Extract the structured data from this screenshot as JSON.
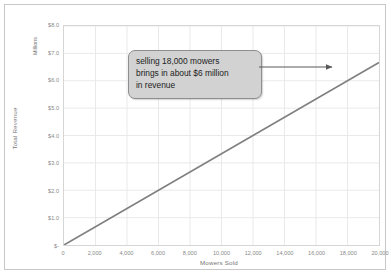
{
  "chart_data": {
    "type": "line",
    "title": "",
    "xlabel": "Mowers Sold",
    "ylabel": "Total Revenue",
    "y_unit_label": "Millions",
    "xlim": [
      0,
      20000
    ],
    "ylim": [
      0,
      8
    ],
    "grid": true,
    "legend": "none",
    "x_tick_labels": [
      "0",
      "2,000",
      "4,000",
      "6,000",
      "8,000",
      "10,000",
      "12,000",
      "14,000",
      "16,000",
      "18,000",
      "20,000"
    ],
    "x_tick_values": [
      0,
      2000,
      4000,
      6000,
      8000,
      10000,
      12000,
      14000,
      16000,
      18000,
      20000
    ],
    "y_tick_labels": [
      "$-",
      "$1.0",
      "$2.0",
      "$3.0",
      "$4.0",
      "$5.0",
      "$6.0",
      "$7.0",
      "$8.0"
    ],
    "y_tick_values": [
      0,
      1,
      2,
      3,
      4,
      5,
      6,
      7,
      8
    ],
    "series": [
      {
        "name": "Total Revenue",
        "color": "#808080",
        "x": [
          0,
          2000,
          4000,
          6000,
          8000,
          10000,
          12000,
          14000,
          16000,
          18000,
          20000
        ],
        "values": [
          0,
          0.667,
          1.333,
          2.0,
          2.667,
          3.333,
          4.0,
          4.667,
          5.333,
          6.0,
          6.667
        ]
      }
    ],
    "annotations": [
      {
        "name": "callout",
        "text": "selling 18,000 mowers brings in about $6 million in revenue",
        "line1": "selling 18,000 mowers",
        "line2": "brings in about $6 million",
        "line3": "in revenue",
        "points_to_x": 18000,
        "points_to_y": 6.0,
        "fill_color": "#d2d2d2",
        "border_color": "#8e8e8e",
        "arrow_color": "#595959"
      }
    ]
  },
  "axes": {
    "y_title": "Total Revenue",
    "y_unit": "Millions",
    "x_title": "Mowers Sold"
  },
  "callout": {
    "line1": "selling 18,000 mowers",
    "line2": "brings in about $6 million",
    "line3": "in revenue"
  },
  "colors": {
    "line": "#808080",
    "grid": "#e9e9e9",
    "plot_border": "#d6d6d6",
    "frame_border": "#c8c8c8",
    "tick_text": "#8a8a8a",
    "axis_title_text": "#757575"
  }
}
